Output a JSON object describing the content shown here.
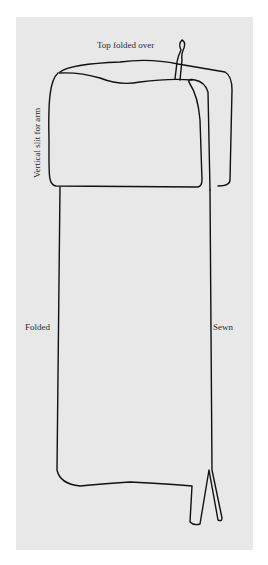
{
  "diagram": {
    "labels": {
      "top": "Top folded over",
      "slit": "Vertical slit for arm",
      "folded": "Folded",
      "sewn": "Sewn"
    },
    "colors": {
      "paper": "#e8e8e8",
      "line": "#111111"
    }
  }
}
